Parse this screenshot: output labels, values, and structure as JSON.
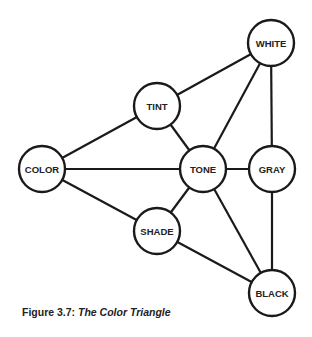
{
  "diagram": {
    "nodes": [
      {
        "id": "white",
        "label": "WHITE",
        "cx": 271,
        "cy": 43,
        "r": 23
      },
      {
        "id": "tint",
        "label": "TINT",
        "cx": 157,
        "cy": 106,
        "r": 23
      },
      {
        "id": "color",
        "label": "COLOR",
        "cx": 42,
        "cy": 169,
        "r": 23
      },
      {
        "id": "tone",
        "label": "TONE",
        "cx": 203,
        "cy": 169,
        "r": 23
      },
      {
        "id": "gray",
        "label": "GRAY",
        "cx": 272,
        "cy": 169,
        "r": 23
      },
      {
        "id": "shade",
        "label": "SHADE",
        "cx": 157,
        "cy": 231,
        "r": 23
      },
      {
        "id": "black",
        "label": "BLACK",
        "cx": 272,
        "cy": 293,
        "r": 23
      }
    ],
    "edges": [
      [
        "color",
        "tint"
      ],
      [
        "tint",
        "white"
      ],
      [
        "color",
        "tone"
      ],
      [
        "color",
        "shade"
      ],
      [
        "tint",
        "tone"
      ],
      [
        "tone",
        "white"
      ],
      [
        "white",
        "gray"
      ],
      [
        "tone",
        "gray"
      ],
      [
        "tone",
        "shade"
      ],
      [
        "tone",
        "black"
      ],
      [
        "gray",
        "black"
      ],
      [
        "shade",
        "black"
      ]
    ]
  },
  "caption": {
    "prefix": "Figure 3.7: ",
    "title": "The Color Triangle"
  }
}
